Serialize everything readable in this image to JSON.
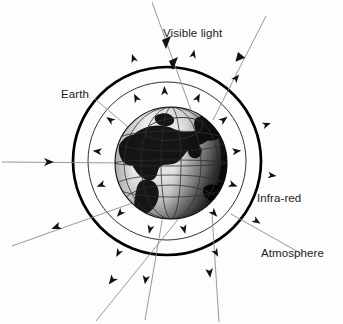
{
  "figure": {
    "kind": "earth-energy-budget-diagram",
    "background_color": "#fdfdfd",
    "labels": {
      "visible_light": "Visible light",
      "earth": "Earth",
      "infra_red": "Infra-red",
      "atmosphere": "Atmosphere"
    },
    "colors": {
      "outline": "#000000",
      "ray": "#8d8d8d",
      "arrowhead": "#111111",
      "land": "#1a1a1a",
      "ocean_light": "#f2f2f2",
      "ocean_dark": "#2a2a2a",
      "grid": "#3a3a3a",
      "label_text": "#1b1b1b"
    },
    "geometry": {
      "canvas": {
        "width": 343,
        "height": 324
      },
      "atmosphere_outer_circle": {
        "cx": 167,
        "cy": 161,
        "r": 94,
        "stroke_width": 2.6
      },
      "atmosphere_inner_circle": {
        "cx": 167,
        "cy": 161,
        "r": 79,
        "stroke_width": 0.9
      },
      "earth_globe": {
        "cx": 171,
        "cy": 163,
        "r": 56
      }
    },
    "incoming_rays": [
      {
        "name": "visible-ray-top",
        "x1": 152,
        "y1": 2,
        "x2": 196,
        "y2": 124,
        "arrow_fracs": [
          0.3,
          0.47
        ]
      },
      {
        "name": "visible-ray-upper-right",
        "x1": 265,
        "y1": 18,
        "x2": 214,
        "y2": 118,
        "arrow_fracs": [
          0.42
        ]
      },
      {
        "name": "visible-ray-left-horizontal",
        "x1": 2,
        "y1": 162,
        "x2": 128,
        "y2": 163,
        "arrow_fracs": [
          0.4
        ]
      },
      {
        "name": "visible-ray-earth-pointer",
        "x1": 96,
        "y1": 100,
        "x2": 140,
        "y2": 137,
        "arrow_fracs": [
          0.92
        ]
      }
    ],
    "outgoing_rays": [
      {
        "name": "reflected-ray-lower-left-upper",
        "x1": 150,
        "y1": 196,
        "x2": 14,
        "y2": 244,
        "arrow_fracs": [
          0.56
        ]
      },
      {
        "name": "reflected-ray-lower-left-lower",
        "x1": 182,
        "y1": 214,
        "x2": 97,
        "y2": 320,
        "arrow_fracs": [
          0.58
        ]
      },
      {
        "name": "reflected-ray-bottom",
        "x1": 178,
        "y1": 130,
        "x2": 146,
        "y2": 318,
        "arrow_fracs": [
          0.86
        ]
      },
      {
        "name": "reflected-ray-bottom-right",
        "x1": 214,
        "y1": 220,
        "x2": 218,
        "y2": 321,
        "arrow_fracs": [
          0.54
        ]
      },
      {
        "name": "reflected-ray-right",
        "x1": 232,
        "y1": 215,
        "x2": 300,
        "y2": 255,
        "arrow_fracs": [
          0.0
        ]
      }
    ],
    "infrared_arrowheads_inner": [
      {
        "angle_deg": 268,
        "r": 70
      },
      {
        "angle_deg": 296,
        "r": 70
      },
      {
        "angle_deg": 324,
        "r": 70
      },
      {
        "angle_deg": 352,
        "r": 70
      },
      {
        "angle_deg": 20,
        "r": 70
      },
      {
        "angle_deg": 48,
        "r": 70
      },
      {
        "angle_deg": 76,
        "r": 70
      },
      {
        "angle_deg": 104,
        "r": 70
      },
      {
        "angle_deg": 132,
        "r": 70
      },
      {
        "angle_deg": 160,
        "r": 70
      },
      {
        "angle_deg": 188,
        "r": 70
      },
      {
        "angle_deg": 216,
        "r": 70
      },
      {
        "angle_deg": 244,
        "r": 70
      }
    ],
    "infrared_arrowheads_outer": [
      {
        "angle_deg": 284,
        "r": 110
      },
      {
        "angle_deg": 310,
        "r": 108
      },
      {
        "angle_deg": 340,
        "r": 106
      },
      {
        "angle_deg": 8,
        "r": 106
      },
      {
        "angle_deg": 34,
        "r": 108
      },
      {
        "angle_deg": 62,
        "r": 104
      },
      {
        "angle_deg": 118,
        "r": 104
      },
      {
        "angle_deg": 252,
        "r": 108
      }
    ],
    "globe_grid": {
      "latitudes": [
        -38,
        -14,
        12,
        36
      ],
      "longitudes": [
        -62,
        -31,
        0,
        31,
        62
      ],
      "arctic_ellipse": {
        "cx": 174,
        "cy": 129,
        "rx": 29,
        "ry": 11,
        "rotate": -8
      }
    },
    "landmasses": [
      "eurasia-africa-mass",
      "north-america-mass",
      "south-america-mass",
      "greenland-mass",
      "east-asia-mass",
      "arabia-mass",
      "australia-mass"
    ]
  }
}
